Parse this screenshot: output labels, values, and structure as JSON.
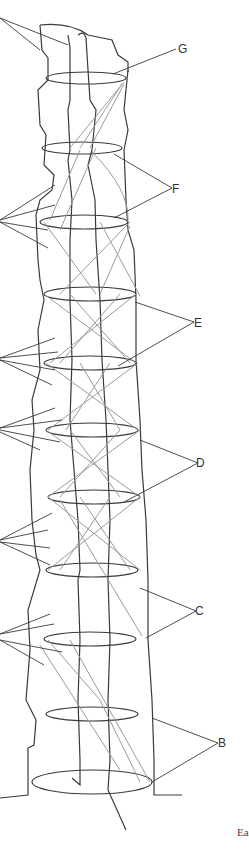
{
  "figure": {
    "caption_fragment": "Ea",
    "labels": [
      {
        "id": "G",
        "text": "G",
        "x": 178,
        "y": 43
      },
      {
        "id": "F",
        "text": "F",
        "x": 172,
        "y": 183
      },
      {
        "id": "E",
        "text": "E",
        "x": 194,
        "y": 317
      },
      {
        "id": "D",
        "text": "D",
        "x": 196,
        "y": 457
      },
      {
        "id": "C",
        "text": "C",
        "x": 195,
        "y": 605
      },
      {
        "id": "B",
        "text": "B",
        "x": 218,
        "y": 737
      }
    ],
    "rings_y": [
      78,
      148,
      222,
      294,
      363,
      429,
      497,
      570,
      639,
      714,
      782
    ],
    "line_color": "#3a3a3a",
    "brace_color": "#9a9a9a"
  }
}
